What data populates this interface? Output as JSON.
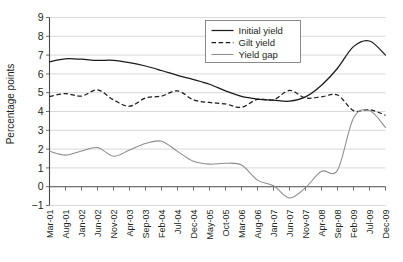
{
  "chart_data": {
    "type": "line",
    "title": "",
    "xlabel": "",
    "ylabel": "Percentage points",
    "ylim": [
      -1,
      9
    ],
    "yticks": [
      "-1",
      "0",
      "1",
      "2",
      "3",
      "4",
      "5",
      "6",
      "7",
      "8",
      "9"
    ],
    "grid": true,
    "legend_position": "top-center",
    "categories": [
      "Mar-01",
      "Aug-01",
      "Jan-02",
      "Jun-02",
      "Nov-02",
      "Apr-03",
      "Sep-03",
      "Feb-04",
      "Jul-04",
      "Dec-04",
      "May-05",
      "Oct-05",
      "Mar-06",
      "Aug-06",
      "Jan-07",
      "Jun-07",
      "Nov-07",
      "Apr-08",
      "Sep-08",
      "Feb-09",
      "Jul-09",
      "Dec-09"
    ],
    "series": [
      {
        "name": "Initial yield",
        "style": "solid",
        "color": "#1a1a1a",
        "values": [
          6.65,
          6.8,
          6.78,
          6.72,
          6.72,
          6.6,
          6.42,
          6.18,
          5.92,
          5.7,
          5.45,
          5.1,
          4.8,
          4.66,
          4.6,
          4.55,
          4.78,
          5.4,
          6.3,
          7.45,
          7.75,
          7.0
        ]
      },
      {
        "name": "Gilt yield",
        "style": "dashed",
        "color": "#1a1a1a",
        "values": [
          4.8,
          4.95,
          4.82,
          5.15,
          4.62,
          4.28,
          4.72,
          4.82,
          5.1,
          4.62,
          4.48,
          4.4,
          4.22,
          4.65,
          4.62,
          5.12,
          4.72,
          4.78,
          4.88,
          4.05,
          4.1,
          3.8
        ]
      },
      {
        "name": "Yield gap",
        "style": "solid",
        "color": "#8c8c8c",
        "values": [
          1.88,
          1.68,
          1.9,
          2.08,
          1.62,
          1.95,
          2.3,
          2.42,
          1.88,
          1.35,
          1.2,
          1.25,
          1.15,
          0.35,
          0.05,
          -0.6,
          -0.05,
          0.82,
          0.88,
          3.65,
          4.05,
          3.15
        ]
      }
    ],
    "detail_points": {
      "comment": "dense monthly sampling used to draw the traced curves",
      "x_index_step": 0.2
    }
  },
  "legend": {
    "items": [
      {
        "label": "Initial yield",
        "style": "solid",
        "color": "#1a1a1a"
      },
      {
        "label": "Gilt yield",
        "style": "dashed",
        "color": "#1a1a1a"
      },
      {
        "label": "Yield gap",
        "style": "solid",
        "color": "#8c8c8c"
      }
    ]
  },
  "axes": {
    "y_axis_title": "Percentage points",
    "y_min": -1,
    "y_max": 9
  }
}
